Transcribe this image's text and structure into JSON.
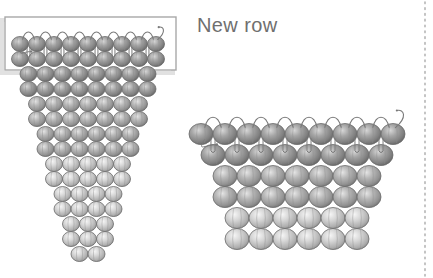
{
  "figure": {
    "title_label": "New row",
    "background_color": "#ffffff",
    "label_color": "#6f6f6f",
    "bead_outline_color": "#6b6b6b",
    "thread_color": "#7a7a7a",
    "highlight_border_color": "#a8a8a8",
    "highlight_shadow_color": "#c9c9c9",
    "divider_color": "#b5b5b5"
  },
  "highlight_box": {
    "name": "new-row-highlight",
    "x": 5,
    "y": 17,
    "width": 171,
    "height": 53
  },
  "divider": {
    "name": "right-dotted-divider",
    "x": 425,
    "y_start": 2,
    "y_end": 276,
    "style": "dotted"
  },
  "left_structure": {
    "name": "decreasing-triangle-weave",
    "origin_x": 88,
    "origin_y": 44,
    "bead_width": 17,
    "bead_height": 15,
    "row_step": 15,
    "rows": [
      {
        "count": 9,
        "shade": "dark"
      },
      {
        "count": 9,
        "shade": "dark"
      },
      {
        "count": 8,
        "shade": "dark"
      },
      {
        "count": 8,
        "shade": "dark"
      },
      {
        "count": 7,
        "shade": "mid"
      },
      {
        "count": 7,
        "shade": "mid"
      },
      {
        "count": 6,
        "shade": "mid"
      },
      {
        "count": 6,
        "shade": "mid"
      },
      {
        "count": 5,
        "shade": "light"
      },
      {
        "count": 5,
        "shade": "light"
      },
      {
        "count": 4,
        "shade": "light"
      },
      {
        "count": 4,
        "shade": "light"
      },
      {
        "count": 3,
        "shade": "light"
      },
      {
        "count": 3,
        "shade": "light"
      },
      {
        "count": 2,
        "shade": "light"
      }
    ],
    "threaded_row_index": 0
  },
  "right_structure": {
    "name": "trapezoid-weave",
    "origin_x": 297,
    "origin_y": 134,
    "bead_width": 24,
    "bead_height": 21,
    "row_step": 21,
    "rows": [
      {
        "count": 9,
        "shade": "dark"
      },
      {
        "count": 8,
        "shade": "dark"
      },
      {
        "count": 7,
        "shade": "mid"
      },
      {
        "count": 7,
        "shade": "mid"
      },
      {
        "count": 6,
        "shade": "light"
      },
      {
        "count": 6,
        "shade": "light"
      }
    ],
    "threaded_row_index": 0
  },
  "bead_shades": {
    "dark": {
      "rim": "#6e6e6e",
      "mid": "#8f8f8f",
      "core": "#cfcfcf",
      "edge": "#5d5d5d"
    },
    "mid": {
      "rim": "#7d7d7d",
      "mid": "#a2a2a2",
      "core": "#dcdcdc",
      "edge": "#6a6a6a"
    },
    "light": {
      "rim": "#9a9a9a",
      "mid": "#bdbdbd",
      "core": "#efefef",
      "edge": "#8a8a8a"
    }
  }
}
